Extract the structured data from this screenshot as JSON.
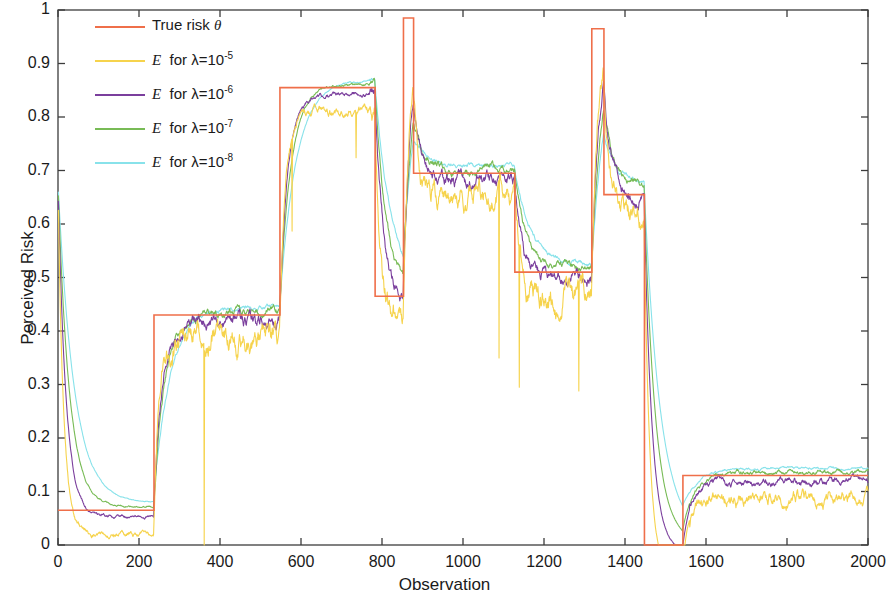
{
  "chart_data": {
    "type": "line",
    "title": "",
    "xlabel": "Observation",
    "ylabel": "Perceived Risk",
    "xlim": [
      0,
      2000
    ],
    "ylim": [
      0,
      1
    ],
    "xticks": [
      0,
      200,
      400,
      600,
      800,
      1000,
      1200,
      1400,
      1600,
      1800,
      2000
    ],
    "yticks": [
      "0",
      "0.1",
      "0.2",
      "0.3",
      "0.4",
      "0.5",
      "0.6",
      "0.7",
      "0.8",
      "0.9",
      "1"
    ],
    "grid": false,
    "legend_position": "upper-left",
    "colors": {
      "true_risk": "#ef6f4a",
      "lambda_1e5": "#f6d34c",
      "lambda_1e6": "#7b3f9d",
      "lambda_1e7": "#78bb56",
      "lambda_1e8": "#88e2ea",
      "axis": "#3c3c3c",
      "text": "#1a1a1a"
    },
    "series": [
      {
        "name": "True risk θ",
        "key": "true_risk",
        "label_html": "True risk <i>θ</i>",
        "color": "#ef6f4a",
        "type": "step",
        "steps": [
          {
            "x0": 0,
            "x1": 237,
            "y": 0.065
          },
          {
            "x0": 237,
            "x1": 548,
            "y": 0.43
          },
          {
            "x0": 548,
            "x1": 783,
            "y": 0.855
          },
          {
            "x0": 783,
            "x1": 853,
            "y": 0.465
          },
          {
            "x0": 853,
            "x1": 878,
            "y": 0.985
          },
          {
            "x0": 878,
            "x1": 1128,
            "y": 0.695
          },
          {
            "x0": 1128,
            "x1": 1318,
            "y": 0.51
          },
          {
            "x0": 1318,
            "x1": 1348,
            "y": 0.965
          },
          {
            "x0": 1348,
            "x1": 1448,
            "y": 0.655
          },
          {
            "x0": 1448,
            "x1": 1543,
            "y": 0.0
          },
          {
            "x0": 1543,
            "x1": 2000,
            "y": 0.13
          }
        ]
      },
      {
        "name": "E for lambda=10^-5",
        "key": "lambda_1e5",
        "label_html": "<i>E</i>&nbsp; for λ=10<sup>-5</sup>",
        "color": "#f6d34c",
        "type": "estimate",
        "noise": 0.055,
        "lag": 14,
        "bias": -0.045,
        "seed": 11
      },
      {
        "name": "E for lambda=10^-6",
        "key": "lambda_1e6",
        "label_html": "<i>E</i>&nbsp; for λ=10<sup>-6</sup>",
        "color": "#7b3f9d",
        "type": "estimate",
        "noise": 0.03,
        "lag": 20,
        "bias": -0.012,
        "seed": 23
      },
      {
        "name": "E for lambda=10^-7",
        "key": "lambda_1e7",
        "label_html": "<i>E</i>&nbsp; for λ=10<sup>-7</sup>",
        "color": "#78bb56",
        "type": "estimate",
        "noise": 0.018,
        "lag": 28,
        "bias": 0.006,
        "seed": 37
      },
      {
        "name": "E for lambda=10^-8",
        "key": "lambda_1e8",
        "label_html": "<i>E</i>&nbsp; for λ=10<sup>-8</sup>",
        "color": "#88e2ea",
        "type": "estimate",
        "noise": 0.01,
        "lag": 40,
        "bias": 0.014,
        "seed": 53
      }
    ],
    "initial_transient": {
      "start_value": 0.675,
      "decay_to": 0.065,
      "end_x": 30
    },
    "annotations": []
  },
  "legend": {
    "entries": [
      {
        "label": "True risk θ"
      },
      {
        "label": "E  for λ=10-5"
      },
      {
        "label": "E  for λ=10-6"
      },
      {
        "label": "E  for λ=10-7"
      },
      {
        "label": "E  for λ=10-8"
      }
    ]
  },
  "axes": {
    "x_title": "Observation",
    "y_title": "Perceived Risk"
  }
}
